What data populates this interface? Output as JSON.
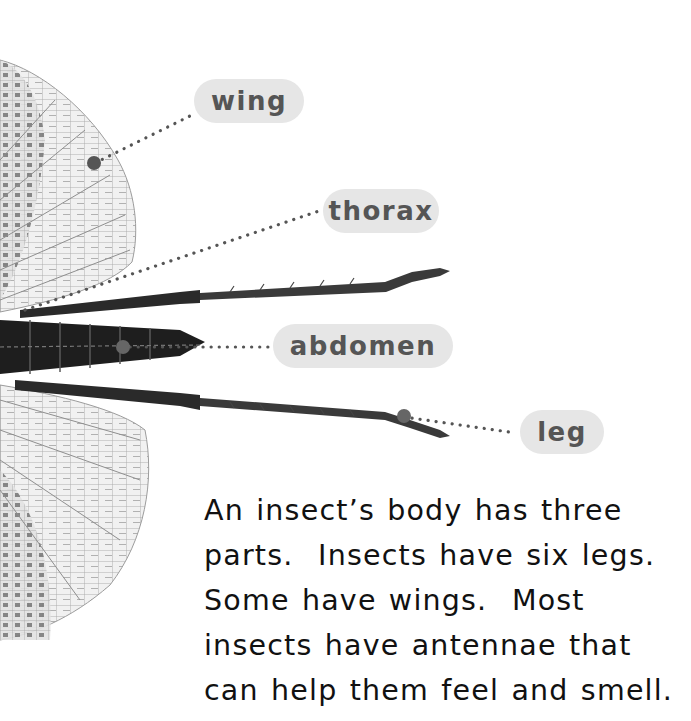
{
  "labels": {
    "wing": "wing",
    "thorax": "thorax",
    "abdomen": "abdomen",
    "leg": "leg"
  },
  "body_text": {
    "lines": [
      "An insect’s body has three",
      "parts.  Insects have six legs.",
      "Some have wings.  Most",
      "insects have antennae that",
      "can help them feel and smell."
    ]
  },
  "colors": {
    "label_bg": "#e6e6e6",
    "label_text": "#555555",
    "pointer_dot": "#555555",
    "body_text": "#111111"
  }
}
